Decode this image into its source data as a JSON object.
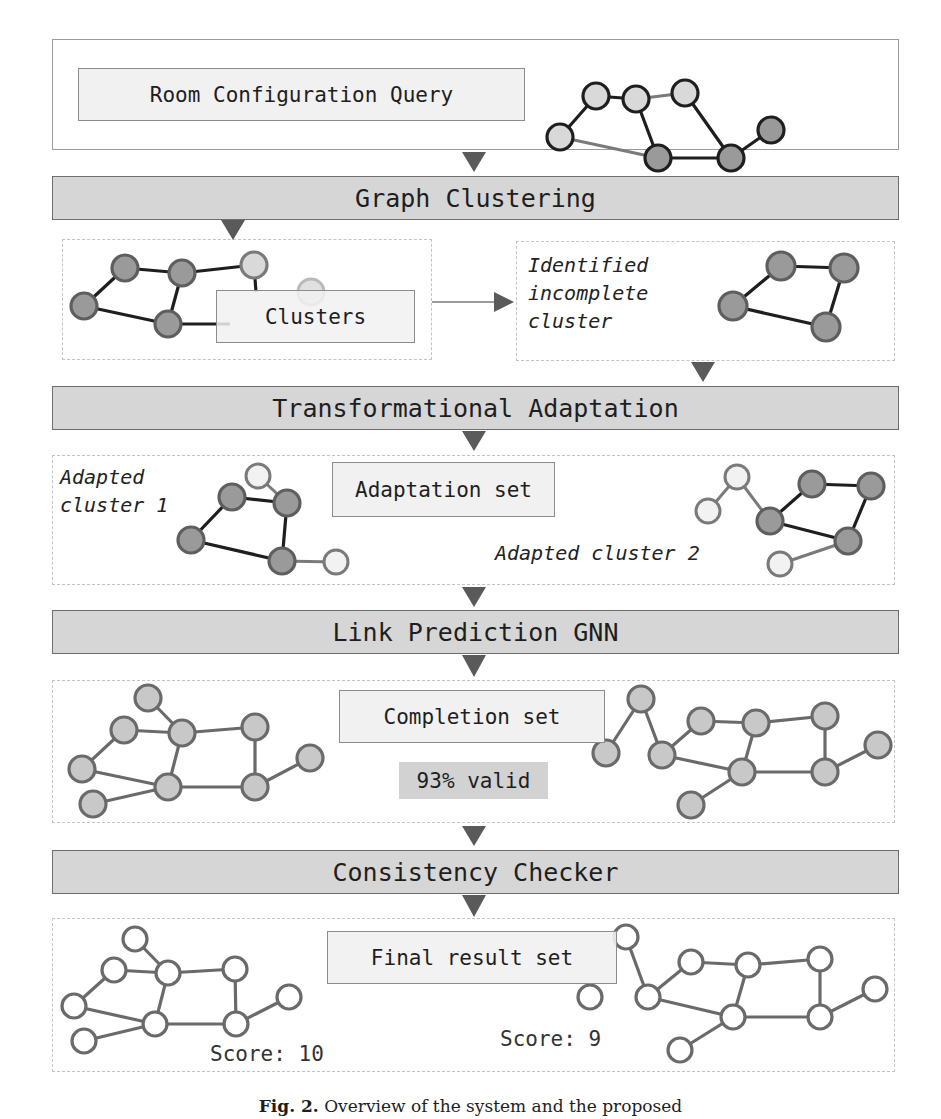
{
  "diagram": {
    "query_box": {
      "label": "Room Configuration Query"
    },
    "stages": [
      {
        "id": "graph-clustering",
        "label": "Graph Clustering"
      },
      {
        "id": "transformational-adaptation",
        "label": "Transformational Adaptation"
      },
      {
        "id": "link-prediction-gnn",
        "label": "Link Prediction GNN"
      },
      {
        "id": "consistency-checker",
        "label": "Consistency Checker"
      }
    ],
    "clusters_panel": {
      "label": "Clusters"
    },
    "identified_panel": {
      "line1": "Identified",
      "line2": "incomplete",
      "line3": "cluster"
    },
    "adaptation_panel": {
      "label": "Adaptation set",
      "cluster1_line1": "Adapted",
      "cluster1_line2": "cluster 1",
      "cluster2": "Adapted cluster 2"
    },
    "completion_panel": {
      "label": "Completion set",
      "validity": "93% valid"
    },
    "final_panel": {
      "label": "Final result set",
      "score_left": "Score: 10",
      "score_right": "Score: 9"
    },
    "caption": {
      "prefix": "Fig. 2.",
      "text": "Overview of the system and the proposed"
    },
    "colors": {
      "band_fill": "#d6d6d6",
      "label_fill": "#f1f1f1",
      "node_light": "#d9d9d9",
      "node_dark": "#9a9a9a",
      "node_white": "#f2f2f2",
      "edge_dark": "#1e1e1e",
      "edge_grey": "#7a7a7a",
      "arrow": "#5a5a5a"
    }
  }
}
